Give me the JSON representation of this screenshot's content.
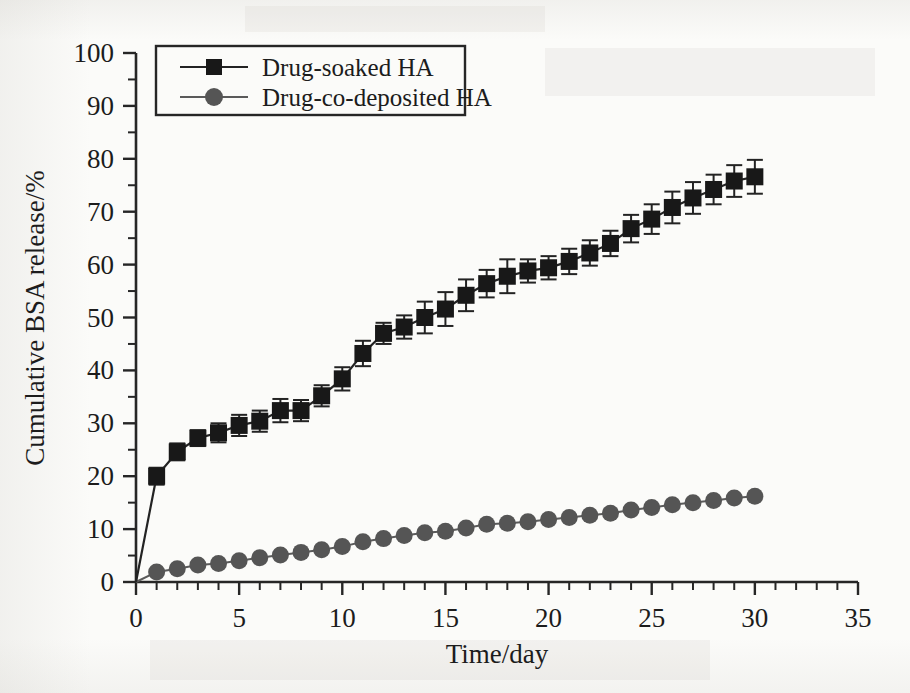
{
  "figure": {
    "background_color": "#fbfbf9",
    "ink_color": "#1c1c1c"
  },
  "chart_data": {
    "type": "line",
    "title": "",
    "subtitle": "",
    "xlabel": "Time/day",
    "ylabel": "Cumulative BSA release/%",
    "xlim": [
      0,
      35
    ],
    "ylim": [
      0,
      100
    ],
    "xticks": [
      0,
      5,
      10,
      15,
      20,
      25,
      30,
      35
    ],
    "xtick_labels": [
      "0",
      "5",
      "10",
      "15",
      "20",
      "25",
      "30",
      "35"
    ],
    "x_minor_step": 1,
    "yticks": [
      0,
      10,
      20,
      30,
      40,
      50,
      60,
      70,
      80,
      90,
      100
    ],
    "ytick_labels": [
      "0",
      "10",
      "20",
      "30",
      "40",
      "50",
      "60",
      "70",
      "80",
      "90",
      "100"
    ],
    "y_minor_step": 5,
    "grid": false,
    "legend_position": "top-left",
    "x": [
      0,
      1,
      2,
      3,
      4,
      5,
      6,
      7,
      8,
      9,
      10,
      11,
      12,
      13,
      14,
      15,
      16,
      17,
      18,
      19,
      20,
      21,
      22,
      23,
      24,
      25,
      26,
      27,
      28,
      29,
      30
    ],
    "series": [
      {
        "name": "Drug-soaked HA",
        "marker": "square",
        "color": "#181818",
        "values": [
          0,
          20.0,
          24.6,
          27.2,
          28.2,
          29.6,
          30.4,
          32.4,
          32.4,
          35.2,
          38.4,
          43.2,
          47.0,
          48.2,
          50.0,
          51.6,
          54.2,
          56.4,
          57.8,
          58.8,
          59.4,
          60.6,
          62.2,
          64.0,
          66.8,
          68.6,
          70.8,
          72.6,
          74.2,
          75.8,
          76.6
        ],
        "errors": [
          0,
          1.6,
          1.6,
          1.5,
          1.8,
          2.0,
          2.0,
          2.2,
          2.0,
          2.0,
          2.2,
          2.4,
          2.0,
          2.2,
          3.0,
          3.2,
          3.0,
          2.6,
          3.2,
          2.2,
          2.2,
          2.4,
          2.4,
          2.4,
          2.6,
          2.8,
          3.0,
          3.0,
          2.8,
          3.0,
          3.2
        ]
      },
      {
        "name": "Drug-co-deposited HA",
        "marker": "circle",
        "color": "#555555",
        "values": [
          0,
          1.9,
          2.5,
          3.2,
          3.5,
          4.0,
          4.6,
          5.1,
          5.6,
          6.1,
          6.7,
          7.6,
          8.2,
          8.8,
          9.3,
          9.6,
          10.2,
          10.9,
          11.1,
          11.4,
          11.8,
          12.2,
          12.6,
          13.0,
          13.6,
          14.1,
          14.6,
          15.0,
          15.4,
          15.9,
          16.2
        ],
        "errors": [
          0,
          0,
          0,
          0,
          0,
          0,
          0,
          0,
          0,
          0,
          0,
          0,
          0,
          0,
          0,
          0,
          0,
          0,
          0,
          0,
          0,
          0,
          0,
          0,
          0,
          0,
          0,
          0,
          0,
          0,
          0
        ]
      }
    ]
  },
  "legend": {
    "entries": [
      {
        "label": "Drug-soaked HA",
        "marker": "square"
      },
      {
        "label": "Drug-co-deposited HA",
        "marker": "circle"
      }
    ]
  }
}
